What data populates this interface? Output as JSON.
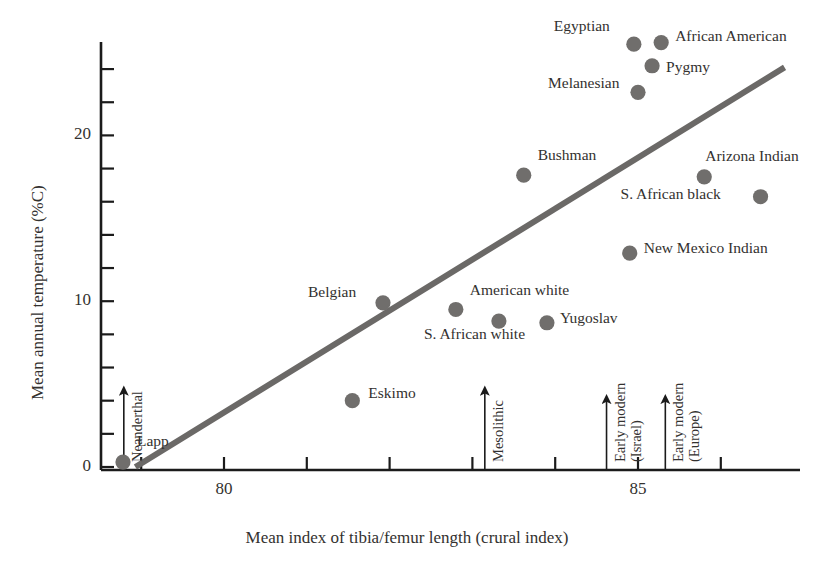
{
  "chart_data": {
    "type": "scatter",
    "title": "",
    "xlabel": "Mean index of tibia/femur length (crural index)",
    "ylabel": "Mean annual temperature (%C)",
    "xlim": [
      78.2,
      86.8
    ],
    "ylim": [
      -0.9,
      26.3
    ],
    "x_ticks": [
      79,
      80,
      81,
      82,
      83,
      84,
      85,
      86
    ],
    "x_tick_labels": [
      "",
      "80",
      "",
      "",
      "",
      "",
      "85",
      ""
    ],
    "y_ticks": [
      0,
      2,
      4,
      6,
      8,
      10,
      12,
      14,
      16,
      18,
      20,
      22,
      24
    ],
    "y_tick_labels": [
      "0",
      "",
      "",
      "",
      "",
      "10",
      "",
      "",
      "",
      "",
      "20",
      "",
      ""
    ],
    "grid": false,
    "legend": false,
    "marker_color": "#706e6c",
    "trend_color": "#6b6967",
    "axis_color": "#1b1b1b",
    "points": [
      {
        "label": "Lapp",
        "x": 78.78,
        "y": 0.3,
        "label_dx": 14,
        "label_dy": -22
      },
      {
        "label": "Eskimo",
        "x": 81.55,
        "y": 4.0,
        "label_dx": 16,
        "label_dy": -9
      },
      {
        "label": "Belgian",
        "x": 81.92,
        "y": 9.9,
        "label_dx": -75,
        "label_dy": -12
      },
      {
        "label": "American white",
        "x": 82.8,
        "y": 9.5,
        "label_dx": 14,
        "label_dy": -20
      },
      {
        "label": "S. African white",
        "x": 83.32,
        "y": 8.8,
        "label_dx": -75,
        "label_dy": 12
      },
      {
        "label": "Yugoslav",
        "x": 83.9,
        "y": 8.7,
        "label_dx": 13,
        "label_dy": -6
      },
      {
        "label": "Bushman",
        "x": 83.62,
        "y": 17.6,
        "label_dx": 14,
        "label_dy": -21
      },
      {
        "label": "New Mexico Indian",
        "x": 84.9,
        "y": 12.9,
        "label_dx": 14,
        "label_dy": -6
      },
      {
        "label": "S. African black",
        "x": 86.48,
        "y": 16.3,
        "label_dx": -140,
        "label_dy": -4
      },
      {
        "label": "Arizona Indian",
        "x": 85.8,
        "y": 17.5,
        "label_dx": 1,
        "label_dy": -22
      },
      {
        "label": "Melanesian",
        "x": 85.0,
        "y": 22.6,
        "label_dx": -90,
        "label_dy": -10
      },
      {
        "label": "Pygmy",
        "x": 85.17,
        "y": 24.2,
        "label_dx": 14,
        "label_dy": 0
      },
      {
        "label": "Egyptian",
        "x": 84.95,
        "y": 25.5,
        "label_dx": -80,
        "label_dy": -19
      },
      {
        "label": "African American",
        "x": 85.28,
        "y": 25.6,
        "label_dx": 14,
        "label_dy": -8
      }
    ],
    "trend_line": {
      "x1": 78.93,
      "y1": 0.0,
      "x2": 86.77,
      "y2": 24.1
    },
    "arrow_annotations": [
      {
        "label": "Neanderthal",
        "label_line2": "",
        "x": 78.79,
        "y_top": 4.6
      },
      {
        "label": "Mesolithic",
        "label_line2": "",
        "x": 83.15,
        "y_top": 4.6
      },
      {
        "label": "Early modern",
        "label_line2": "(Israel)",
        "x": 84.62,
        "y_top": 4.1
      },
      {
        "label": "Early modern",
        "label_line2": "(Europe)",
        "x": 85.33,
        "y_top": 4.1
      }
    ]
  }
}
